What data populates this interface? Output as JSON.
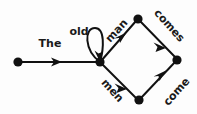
{
  "diagram": {
    "kind": "word-lattice",
    "background_color": "#fdfdfd",
    "ink_color": "#111111",
    "text_color": "#1a1a1a",
    "width": 197,
    "height": 114,
    "nodes": [
      {
        "id": "n0",
        "name": "start-node",
        "x": 18,
        "y": 62
      },
      {
        "id": "n1",
        "name": "center-node",
        "x": 100,
        "y": 62
      },
      {
        "id": "n2",
        "name": "top-node",
        "x": 138,
        "y": 19
      },
      {
        "id": "n3",
        "name": "bottom-node",
        "x": 139,
        "y": 100
      },
      {
        "id": "n4",
        "name": "end-node",
        "x": 177,
        "y": 60
      }
    ],
    "edges": [
      {
        "id": "e-the",
        "name": "edge-the",
        "label": "The",
        "from": "n0",
        "to": "n1",
        "label_x": 50,
        "label_y": 44,
        "label_rotate": 0
      },
      {
        "id": "e-old",
        "name": "edge-old-selfloop",
        "label": "old",
        "from": "n1",
        "to": "n1",
        "self_loop": true,
        "label_x": 79,
        "label_y": 32,
        "label_rotate": 0
      },
      {
        "id": "e-man",
        "name": "edge-man",
        "label": "man",
        "from": "n1",
        "to": "n2",
        "label_x": 117,
        "label_y": 31,
        "label_rotate": -48
      },
      {
        "id": "e-men",
        "name": "edge-men",
        "label": "men",
        "from": "n1",
        "to": "n3",
        "label_x": 112,
        "label_y": 91,
        "label_rotate": 48
      },
      {
        "id": "e-comes",
        "name": "edge-comes",
        "label": "comes",
        "from": "n2",
        "to": "n4",
        "label_x": 169,
        "label_y": 26,
        "label_rotate": 48
      },
      {
        "id": "e-come",
        "name": "edge-come",
        "label": "come",
        "from": "n3",
        "to": "n4",
        "label_x": 177,
        "label_y": 92,
        "label_rotate": -48
      }
    ]
  }
}
